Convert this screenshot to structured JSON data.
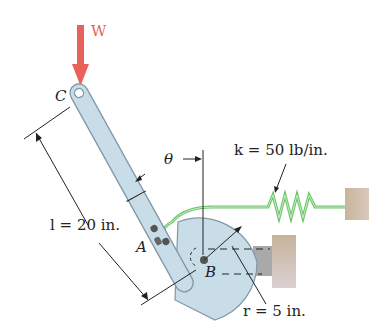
{
  "figure": {
    "load_label": "W",
    "point_c": "C",
    "point_a": "A",
    "point_b": "B",
    "angle_label": "θ",
    "length_label": "l = 20 in.",
    "spring_label": "k = 50 lb/in.",
    "radius_label": "r = 5 in.",
    "colors": {
      "load_arrow": "#e8625a",
      "bar_fill": "#c9dde8",
      "bar_stroke": "#7f98a8",
      "spring": "#6cc56a",
      "support": "#b8a48e"
    }
  }
}
